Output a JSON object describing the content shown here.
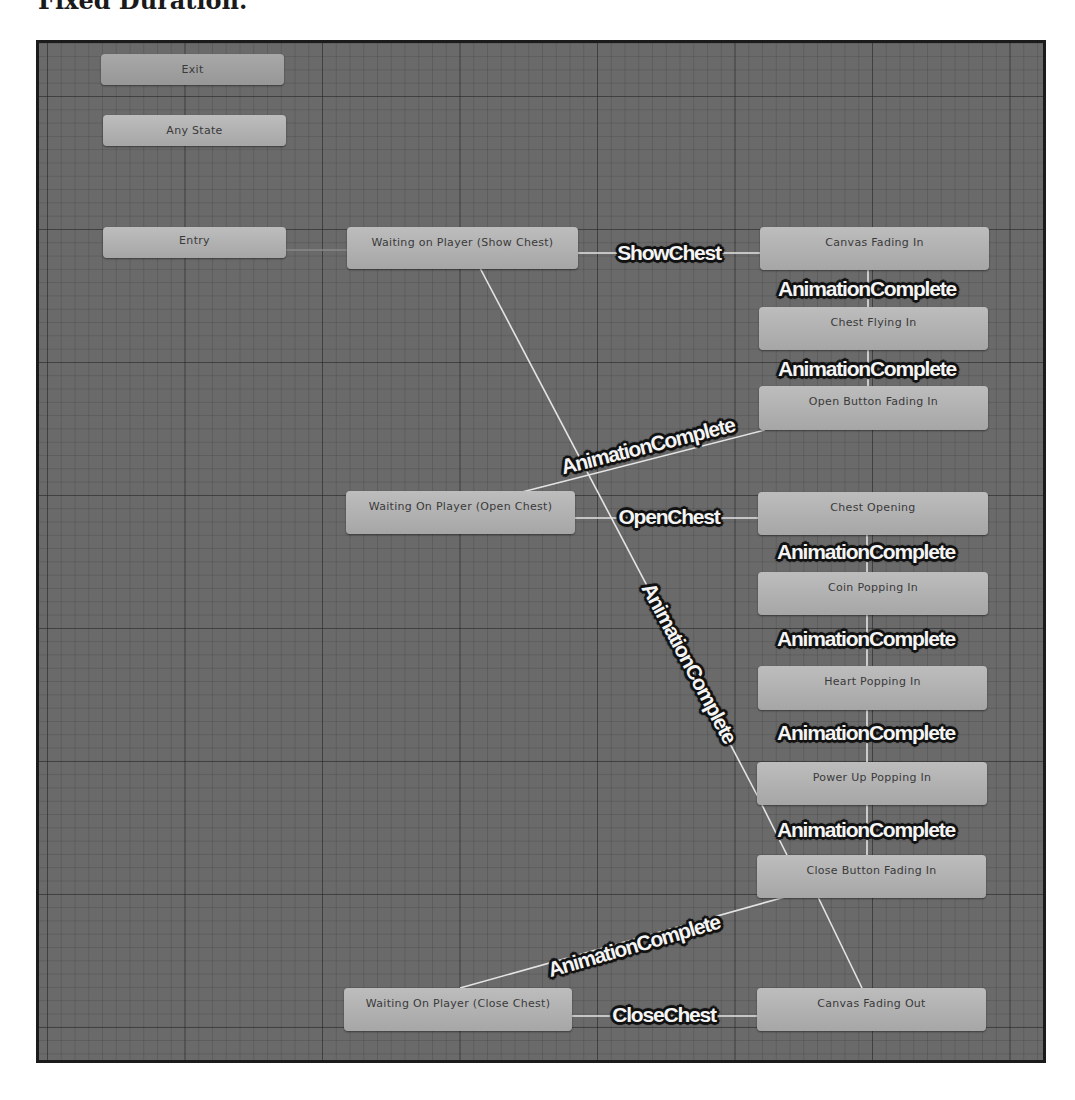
{
  "page": {
    "heading": "Fixed Duration."
  },
  "states": {
    "exit": "Exit",
    "any_state": "Any State",
    "entry": "Entry",
    "waiting_show_chest": "Waiting on Player (Show Chest)",
    "canvas_fading_in": "Canvas Fading In",
    "chest_flying_in": "Chest Flying In",
    "open_button_fading_in": "Open Button Fading In",
    "waiting_open_chest": "Waiting On Player (Open Chest)",
    "chest_opening": "Chest Opening",
    "coin_popping_in": "Coin Popping In",
    "heart_popping_in": "Heart Popping In",
    "power_up_popping_in": "Power Up Popping In",
    "close_button_fading_in": "Close Button Fading In",
    "waiting_close_chest": "Waiting On Player (Close Chest)",
    "canvas_fading_out": "Canvas Fading Out"
  },
  "transitions": {
    "show_chest": "ShowChest",
    "canvas_to_chest_flying": "AnimationComplete",
    "chest_flying_to_open_button": "AnimationComplete",
    "open_button_to_waiting_open": "AnimationComplete",
    "open_chest": "OpenChest",
    "chest_opening_to_coin": "AnimationComplete",
    "coin_to_heart": "AnimationComplete",
    "heart_to_power_up": "AnimationComplete",
    "power_up_to_close_button": "AnimationComplete",
    "canvas_out_to_waiting_show": "AnimationComplete",
    "close_button_to_waiting_close": "AnimationComplete",
    "close_chest": "CloseChest"
  },
  "colors": {
    "canvas_bg": "#6a6a6a",
    "node_fill": "#b3b3b3",
    "link": "#e6e6e6",
    "label_text": "#f4f4f4",
    "label_outline": "#111111"
  }
}
